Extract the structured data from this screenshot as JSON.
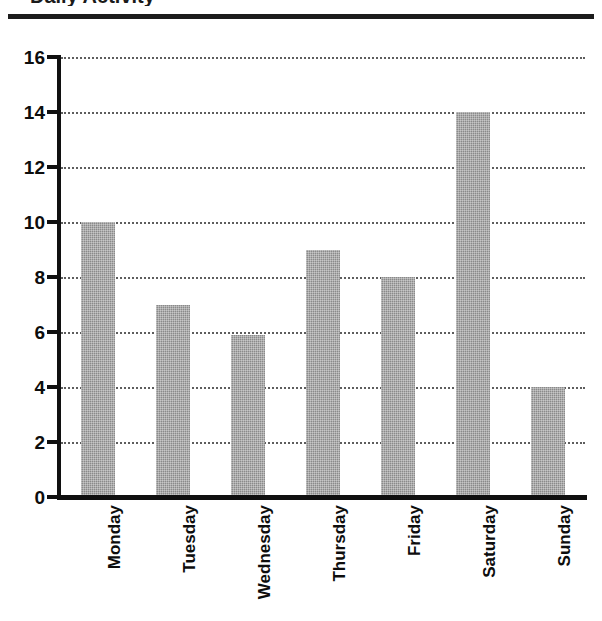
{
  "title_remnant": "Daily Activity",
  "chart_data": {
    "type": "bar",
    "title": "",
    "xlabel": "",
    "ylabel": "",
    "categories": [
      "Monday",
      "Tuesday",
      "Wednesday",
      "Thursday",
      "Friday",
      "Saturday",
      "Sunday"
    ],
    "values": [
      10,
      7,
      5.9,
      9,
      8,
      14,
      4
    ],
    "ylim": [
      0,
      16
    ],
    "yticks": [
      0,
      2,
      4,
      6,
      8,
      10,
      12,
      14,
      16
    ],
    "ytick_labels": [
      "0",
      "2",
      "4",
      "6",
      "8",
      "10",
      "12",
      "14",
      "16"
    ],
    "grid": true,
    "grid_style": "dotted",
    "grid_axis": "y",
    "legend": false,
    "bar_color": "#8a8a8a",
    "axis_color": "#101010",
    "grid_color": "#5d5d5d",
    "label_rotation": 90,
    "background": "#ffffff"
  }
}
